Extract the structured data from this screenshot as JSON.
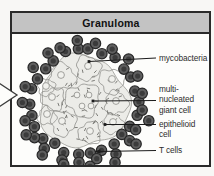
{
  "title": "Granuloma",
  "labels": {
    "mycobacteria": "mycobacteria",
    "giant_cell": "multi-\nnucleated\ngiant cell",
    "epithelioid": "epithelioid\ncell",
    "t_cells": "T cells"
  },
  "colors": {
    "titlebar_bg": "#c3c3c3",
    "frame_border": "#2a2a2a",
    "t_cell_fill": "#5f5f5f",
    "t_cell_stroke": "#272727",
    "t_cell_core": "#3b3b3b",
    "blob_fill": "#ececE8",
    "blob_stroke": "#9a9a96",
    "cell_outline": "#8d8d89",
    "nucleus_fill": "#f1f1ed",
    "dash_color": "#6f6f6b",
    "leader_color": "#1c1c1c",
    "label_color": "#2d2d2d",
    "arrow_fill": "#fdfdfb",
    "arrow_stroke": "#3a3a3a"
  }
}
